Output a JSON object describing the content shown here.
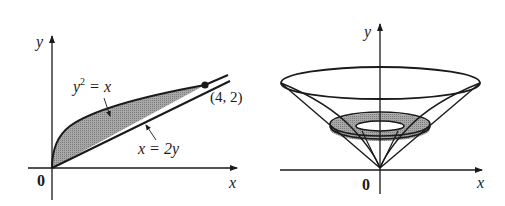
{
  "left_figure": {
    "axis_x_label": "x",
    "axis_y_label": "y",
    "origin_label": "0",
    "curve_upper_label": "y",
    "curve_upper_label_exp": "2",
    "curve_upper_label_rest": " = x",
    "curve_lower_label": "x = 2y",
    "point_label": "(4, 2)",
    "point": [
      4,
      2
    ],
    "region": "between y^2 = x and x = 2y, from (0,0) to (4,2)",
    "fill_color": "#9a9a9a"
  },
  "right_figure": {
    "axis_x_label": "x",
    "axis_y_label": "y",
    "origin_label": "0",
    "description": "solid of revolution (cone-like) about y-axis with shaded washer cross-section",
    "fill_color": "#9a9a9a"
  }
}
